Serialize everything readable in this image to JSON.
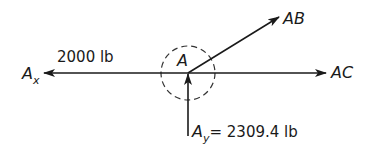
{
  "diagram": {
    "type": "free-body-diagram",
    "point": {
      "label": "A"
    },
    "forces": [
      {
        "id": "Ax",
        "label": "A",
        "subscript": "x",
        "magnitude_text": "2000 lb",
        "direction": "left"
      },
      {
        "id": "AB",
        "label": "AB",
        "direction": "up-right"
      },
      {
        "id": "AC",
        "label": "AC",
        "direction": "right"
      },
      {
        "id": "Ay",
        "label": "A",
        "subscript": "y",
        "magnitude_text": "= 2309.4 lb",
        "direction": "up"
      }
    ],
    "colors": {
      "stroke": "#1a1a1a",
      "background": "#ffffff"
    }
  }
}
